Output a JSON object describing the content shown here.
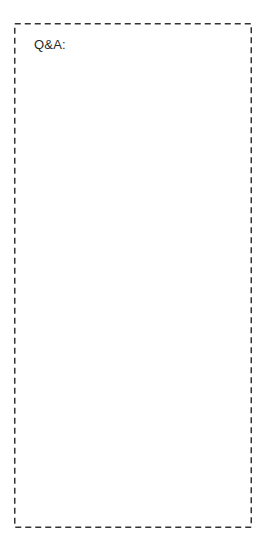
{
  "header": {
    "clipped_text": ""
  },
  "qa_section": {
    "label": "Q&A:",
    "content": "",
    "border": {
      "style": "dashed",
      "color": "#333333"
    }
  }
}
